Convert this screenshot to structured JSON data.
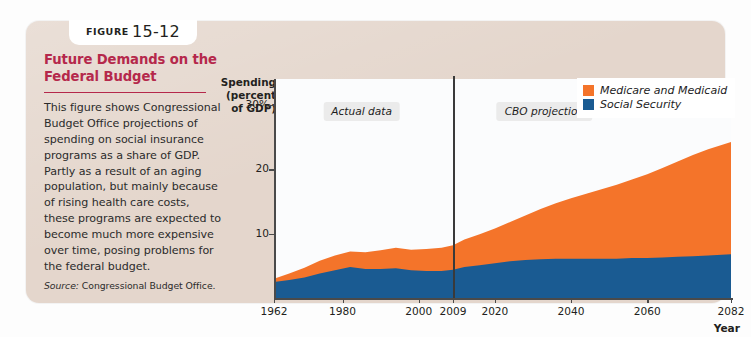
{
  "figure": {
    "badge_word": "FIGURE",
    "badge_number": "15-12",
    "title": "Future Demands on the Federal Budget",
    "body": "This figure shows Congressional Budget Office projections of spending on social insurance programs as a share of GDP. Partly as a result of an aging population, but mainly because of rising health care costs, these programs are expected to become much more expensive over time, posing problems for the federal budget.",
    "source_label": "Source:",
    "source_text": "Congressional Budget Office.",
    "title_color": "#b5284b",
    "panel_color": "#e4d6cc"
  },
  "chart_data": {
    "type": "area",
    "stacked": true,
    "title": "",
    "ylabel": "Spending\n(percent\nof GDP)",
    "xlabel": "Year",
    "xlim": [
      1962,
      2082
    ],
    "ylim": [
      0,
      34
    ],
    "grid": false,
    "legend_position": "top-right",
    "ytick_labels": [
      "30%",
      "20",
      "10"
    ],
    "ytick_values": [
      30,
      20,
      10
    ],
    "xtick_values": [
      1962,
      1980,
      2000,
      2009,
      2020,
      2040,
      2060,
      2082
    ],
    "xtick_labels": [
      "1962",
      "1980",
      "2000",
      "2009",
      "2020",
      "2040",
      "2060",
      "2082"
    ],
    "annotations": [
      {
        "text": "Actual data",
        "x": 1985,
        "y": 29
      },
      {
        "text": "CBO projection",
        "x": 2033,
        "y": 29
      }
    ],
    "divider": {
      "x": 2009,
      "label": "2009 actual/projection boundary"
    },
    "colors": {
      "medicare_medicaid": "#f4742a",
      "social_security": "#1a5b92",
      "plot_background": "#fbfcfd"
    },
    "x": [
      1962,
      1966,
      1970,
      1974,
      1978,
      1982,
      1986,
      1990,
      1994,
      1998,
      2002,
      2006,
      2009,
      2012,
      2016,
      2020,
      2024,
      2028,
      2032,
      2036,
      2040,
      2044,
      2048,
      2052,
      2056,
      2060,
      2064,
      2068,
      2072,
      2076,
      2082
    ],
    "series": [
      {
        "name": "Social Security",
        "color": "#1a5b92",
        "values": [
          2.5,
          2.8,
          3.2,
          3.8,
          4.3,
          4.8,
          4.5,
          4.5,
          4.6,
          4.3,
          4.2,
          4.2,
          4.4,
          4.8,
          5.1,
          5.4,
          5.7,
          5.9,
          6.0,
          6.1,
          6.1,
          6.1,
          6.1,
          6.1,
          6.2,
          6.2,
          6.3,
          6.4,
          6.5,
          6.6,
          6.8
        ]
      },
      {
        "name": "Medicare and Medicaid",
        "color": "#f4742a",
        "values": [
          0.5,
          1.0,
          1.5,
          2.0,
          2.3,
          2.4,
          2.6,
          2.9,
          3.2,
          3.2,
          3.4,
          3.6,
          3.8,
          4.3,
          4.8,
          5.4,
          6.1,
          6.9,
          7.8,
          8.6,
          9.4,
          10.1,
          10.8,
          11.5,
          12.2,
          13.0,
          13.9,
          14.8,
          15.7,
          16.5,
          17.4
        ]
      }
    ],
    "totals": [
      3.0,
      3.8,
      4.7,
      5.8,
      6.6,
      7.2,
      7.1,
      7.4,
      7.8,
      7.5,
      7.6,
      7.8,
      8.2,
      9.1,
      9.9,
      10.8,
      11.8,
      12.8,
      13.8,
      14.7,
      15.5,
      16.2,
      16.9,
      17.6,
      18.4,
      19.2,
      20.2,
      21.2,
      22.2,
      23.1,
      24.2
    ]
  }
}
